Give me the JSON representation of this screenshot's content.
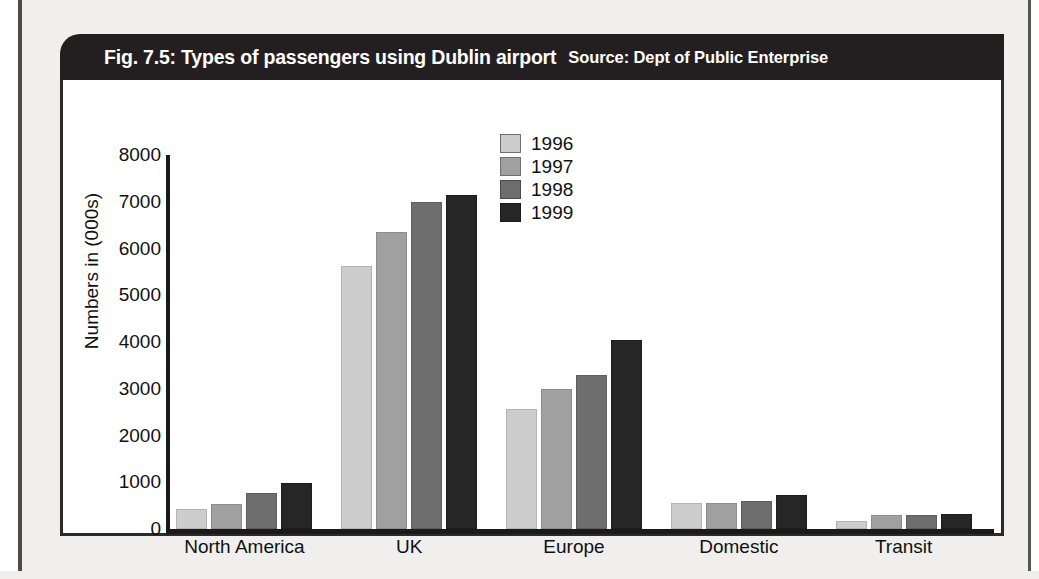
{
  "figure": {
    "title": "Fig. 7.5: Types of passengers using Dublin airport",
    "source": "Source: Dept of Public Enterprise"
  },
  "chart_data": {
    "type": "bar",
    "title": "Fig. 7.5: Types of passengers using Dublin airport",
    "subtitle": "Source: Dept of Public Enterprise",
    "xlabel": "",
    "ylabel": "Numbers in (000s)",
    "ylim": [
      0,
      8000
    ],
    "yticks": [
      0,
      1000,
      2000,
      3000,
      4000,
      5000,
      6000,
      7000,
      8000
    ],
    "ytick_labels": [
      "0",
      "1000",
      "2000",
      "3000",
      "4000",
      "5000",
      "6000",
      "7000",
      "8000"
    ],
    "grid": false,
    "legend_position": "upper center",
    "categories": [
      "North America",
      "UK",
      "Europe",
      "Domestic",
      "Transit"
    ],
    "series": [
      {
        "name": "1996",
        "color": "#cdcdcd",
        "values": [
          420,
          5620,
          2560,
          550,
          180
        ]
      },
      {
        "name": "1997",
        "color": "#a0a0a0",
        "values": [
          530,
          6360,
          3000,
          560,
          290
        ]
      },
      {
        "name": "1998",
        "color": "#6e6e6e",
        "values": [
          770,
          7000,
          3300,
          600,
          310
        ]
      },
      {
        "name": "1999",
        "color": "#262626",
        "values": [
          990,
          7150,
          4050,
          720,
          320
        ]
      }
    ]
  }
}
